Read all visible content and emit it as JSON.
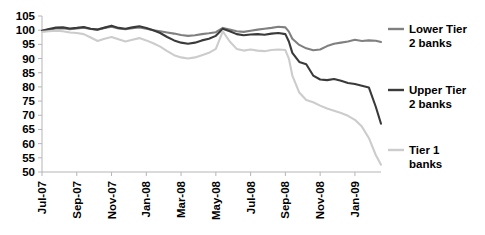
{
  "chart_data": {
    "type": "line",
    "title": "",
    "xlabel": "",
    "ylabel": "",
    "ylim": [
      50,
      105
    ],
    "ytick_step": 5,
    "yticks": [
      50,
      55,
      60,
      65,
      70,
      75,
      80,
      85,
      90,
      95,
      100,
      105
    ],
    "grid": false,
    "legend_position": "right",
    "x_tick_labels": [
      "Jul-07",
      "Sep-07",
      "Nov-07",
      "Jan-08",
      "Mar-08",
      "May-08",
      "Jul-08",
      "Sep-08",
      "Nov-08",
      "Jan-09"
    ],
    "x_tick_months": [
      0,
      2,
      4,
      6,
      8,
      10,
      12,
      14,
      16,
      18
    ],
    "x_range_months": [
      0,
      19.5
    ],
    "series": [
      {
        "name": "Lower Tier 2 banks",
        "color": "#808080",
        "legend_label_line1": "Lower Tier",
        "legend_label_line2": "2 banks",
        "x": [
          0,
          0.4,
          0.8,
          1.2,
          1.6,
          2,
          2.4,
          2.8,
          3.2,
          3.6,
          4,
          4.4,
          4.8,
          5.2,
          5.6,
          6,
          6.4,
          6.8,
          7.2,
          7.6,
          8,
          8.4,
          8.8,
          9.2,
          9.6,
          10,
          10.4,
          10.8,
          11.2,
          11.6,
          12,
          12.4,
          12.8,
          13.2,
          13.6,
          14,
          14.2,
          14.4,
          14.8,
          15.2,
          15.6,
          16,
          16.4,
          16.8,
          17.2,
          17.6,
          18,
          18.4,
          18.8,
          19.2,
          19.5
        ],
        "values": [
          99.8,
          100.2,
          100.6,
          100.7,
          100.3,
          100.6,
          100.9,
          100.4,
          100.2,
          100.8,
          101.2,
          100.6,
          100.3,
          100.7,
          101.0,
          100.5,
          100.0,
          99.6,
          99.2,
          98.8,
          98.3,
          98.0,
          98.2,
          98.6,
          98.9,
          99.3,
          100.8,
          100.2,
          99.6,
          99.4,
          99.8,
          100.2,
          100.5,
          100.8,
          101.2,
          101.0,
          99.5,
          97.0,
          94.8,
          93.6,
          92.9,
          93.2,
          94.4,
          95.2,
          95.6,
          96.0,
          96.6,
          96.2,
          96.4,
          96.3,
          95.8
        ]
      },
      {
        "name": "Upper Tier 2 banks",
        "color": "#3a3a3a",
        "legend_label_line1": "Upper Tier",
        "legend_label_line2": "2 banks",
        "x": [
          0,
          0.4,
          0.8,
          1.2,
          1.6,
          2,
          2.4,
          2.8,
          3.2,
          3.6,
          4,
          4.4,
          4.8,
          5.2,
          5.6,
          6,
          6.4,
          6.8,
          7.2,
          7.6,
          8,
          8.4,
          8.8,
          9.2,
          9.6,
          10,
          10.4,
          10.8,
          11.2,
          11.6,
          12,
          12.4,
          12.8,
          13.2,
          13.6,
          14,
          14.2,
          14.4,
          14.8,
          15.2,
          15.6,
          16,
          16.4,
          16.8,
          17.2,
          17.6,
          18,
          18.4,
          18.8,
          19.2,
          19.5
        ],
        "values": [
          99.8,
          100.4,
          100.9,
          101.0,
          100.6,
          100.8,
          101.1,
          100.5,
          100.2,
          100.9,
          101.6,
          100.8,
          100.5,
          101.0,
          101.4,
          100.8,
          100.0,
          99.0,
          97.6,
          96.4,
          95.6,
          95.2,
          95.6,
          96.4,
          97.0,
          98.0,
          100.5,
          99.6,
          98.6,
          98.2,
          98.5,
          98.6,
          98.4,
          98.8,
          99.0,
          98.6,
          96.0,
          92.0,
          88.8,
          88.0,
          84.0,
          82.6,
          82.4,
          82.8,
          82.2,
          81.4,
          81.0,
          80.4,
          79.8,
          73.0,
          67.0
        ]
      },
      {
        "name": "Tier 1 banks",
        "color": "#cccccc",
        "legend_label_line1": "Tier 1",
        "legend_label_line2": "banks",
        "x": [
          0,
          0.4,
          0.8,
          1.2,
          1.6,
          2,
          2.4,
          2.8,
          3.2,
          3.6,
          4,
          4.4,
          4.8,
          5.2,
          5.6,
          6,
          6.4,
          6.8,
          7.2,
          7.6,
          8,
          8.4,
          8.8,
          9.2,
          9.6,
          10,
          10.4,
          10.8,
          11.2,
          11.6,
          12,
          12.4,
          12.8,
          13.2,
          13.6,
          14,
          14.2,
          14.4,
          14.8,
          15.2,
          15.6,
          16,
          16.4,
          16.8,
          17.2,
          17.6,
          18,
          18.4,
          18.8,
          19.2,
          19.5
        ],
        "values": [
          99.4,
          99.6,
          99.8,
          99.6,
          99.2,
          99.0,
          98.6,
          97.4,
          96.2,
          97.0,
          97.6,
          96.8,
          96.0,
          96.6,
          97.2,
          96.4,
          95.4,
          94.2,
          92.6,
          91.2,
          90.4,
          90.0,
          90.4,
          91.2,
          92.0,
          93.4,
          99.6,
          96.0,
          93.4,
          92.8,
          93.2,
          92.8,
          92.6,
          93.0,
          93.2,
          93.0,
          90.0,
          84.0,
          78.0,
          75.4,
          74.6,
          73.4,
          72.4,
          71.6,
          70.8,
          69.8,
          68.4,
          66.0,
          62.0,
          56.0,
          52.6
        ]
      }
    ]
  }
}
